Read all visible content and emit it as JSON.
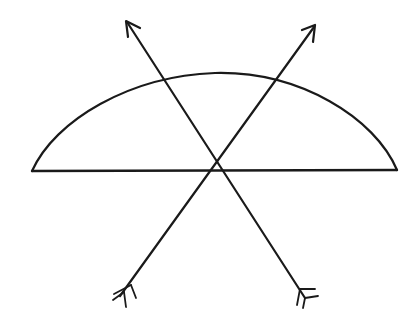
{
  "diagram": {
    "type": "ray-diagram",
    "background": "#ffffff",
    "ink_color": "#1a1a1a",
    "semicircle": {
      "baseline": {
        "x1": 32,
        "y1": 171,
        "x2": 397,
        "y2": 170
      },
      "arc_top": {
        "x": 215,
        "y": 73
      }
    },
    "rays": [
      {
        "name": "left-ray",
        "tail": {
          "x": 305,
          "y": 300
        },
        "head": {
          "x": 126,
          "y": 20
        }
      },
      {
        "name": "right-ray",
        "tail": {
          "x": 118,
          "y": 298
        },
        "head": {
          "x": 315,
          "y": 26
        }
      }
    ],
    "crossing_point": {
      "x": 218,
      "y": 168
    }
  }
}
